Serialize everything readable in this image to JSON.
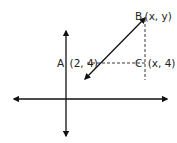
{
  "diagram": {
    "type": "coordinate-plane",
    "colors": {
      "line": "#111111",
      "text": "#222222",
      "background": "#ffffff"
    },
    "points": [
      {
        "id": "A",
        "label": "A",
        "coords": "(2, 4)"
      },
      {
        "id": "B",
        "label": "B",
        "coords": "(x, y)"
      },
      {
        "id": "C",
        "label": "C",
        "coords": "(x, 4)"
      }
    ],
    "elements": [
      "x-axis (double arrow)",
      "y-axis (double arrow)",
      "line through A and B (double arrow)",
      "dashed segment A to C",
      "dashed segment B to C"
    ]
  }
}
